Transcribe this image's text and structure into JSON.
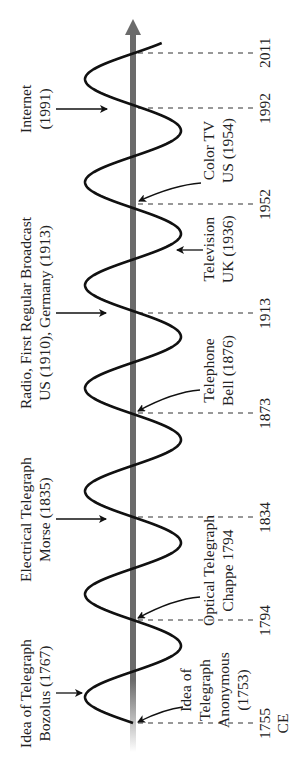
{
  "axis": {
    "color": "#6b6b6b",
    "direction": "up",
    "x": 133,
    "y_start": 747,
    "y_tip": 20
  },
  "wave": {
    "color": "#111111",
    "center_x": 133,
    "amplitude": 48,
    "period_px": 103,
    "y_start": 723,
    "y_end": 43
  },
  "year_ticks": [
    {
      "label": "1755",
      "sub": "CE",
      "y": 723
    },
    {
      "label": "1794",
      "y": 620
    },
    {
      "label": "1834",
      "y": 517
    },
    {
      "label": "1873",
      "y": 413
    },
    {
      "label": "1913",
      "y": 313
    },
    {
      "label": "1952",
      "y": 204
    },
    {
      "label": "1992",
      "y": 108
    },
    {
      "label": "2011",
      "y": 53
    }
  ],
  "events_left": [
    {
      "lines": [
        "Idea of Telegraph",
        "Bozolus (1767)"
      ],
      "y": 693,
      "arrow_to_x": 82
    },
    {
      "lines": [
        "Electrical Telegraph",
        "Morse (1835)"
      ],
      "y": 519,
      "arrow_to_x": 106
    },
    {
      "lines": [
        "Radio, First Regular Broadcast",
        "US (1910), Germany (1913)"
      ],
      "y": 313,
      "arrow_to_x": 106
    },
    {
      "lines": [
        "Internet",
        "(1991)"
      ],
      "y": 109,
      "arrow_to_x": 107
    }
  ],
  "events_right": [
    {
      "lines": [
        "Idea of",
        "Telegraph",
        "Anonymous",
        "(1753)"
      ],
      "y": 690,
      "arrow_from": [
        183,
        707
      ],
      "arrow_to": [
        138,
        722
      ]
    },
    {
      "lines": [
        "Optical Telegraph",
        "Chappe 1794"
      ],
      "y": 570,
      "arrow_from": [
        200,
        597
      ],
      "arrow_to": [
        138,
        618
      ]
    },
    {
      "lines": [
        "Telephone",
        "Bell (1876)"
      ],
      "y": 370,
      "arrow_from": [
        200,
        390
      ],
      "arrow_to": [
        138,
        411
      ]
    },
    {
      "lines": [
        "Television",
        "UK (1936)"
      ],
      "y": 249,
      "arrow_from": [
        203,
        250
      ],
      "arrow_to": [
        177,
        250
      ]
    },
    {
      "lines": [
        "Color TV",
        "US (1954)"
      ],
      "y": 150,
      "arrow_from": [
        201,
        183
      ],
      "arrow_to": [
        139,
        201
      ]
    }
  ]
}
